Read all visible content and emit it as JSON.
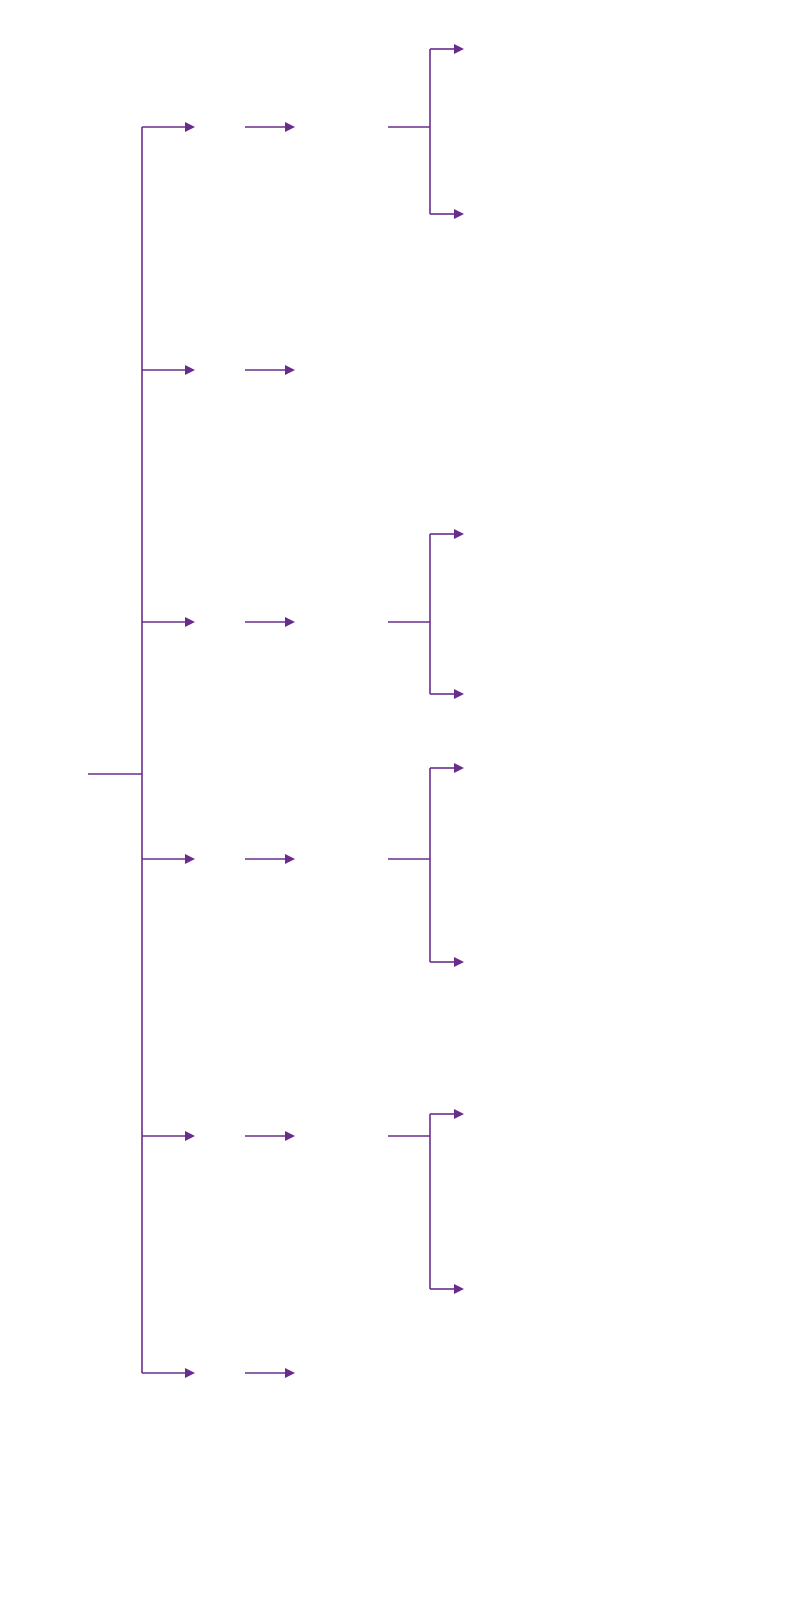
{
  "root": {
    "label": "hCG, LH, T e E2"
  },
  "branches": [
    {
      "id": "hcg",
      "result": "↑ hCG",
      "next": "US testicular",
      "outcomes": [
        "Massa: tumor testicular de células germinativas",
        "Normal: tumor germinativo extragonadal"
      ]
    },
    {
      "id": "lh-up-t-down",
      "result": "↑ LH, ↓ T",
      "next": "Hipogonadismo primário",
      "outcomes": []
    },
    {
      "id": "lh-down-t-down",
      "result": "↓ ou N LH, ↓ T",
      "next": "Medir prolactina",
      "outcomes": [
        "Elevada: tumor hipofisário",
        "Normal: hipogonadismo secundário"
      ]
    },
    {
      "id": "lh-up-t-up",
      "result": "↑ LH, ↑ T",
      "next_main": "Medir T",
      "next_sub": "4",
      "next_tail": "e TSH",
      "outcomes_a_pre": "↑ T",
      "outcomes_a_sub": "4",
      "outcomes_a_post": ", ↓ TSH:",
      "outcomes_a_line2": "hipertireoidismo",
      "outcomes": [
        "↑ T4, ↓ TSH: hipertireoidismo",
        "Normal: resistência androgênica"
      ]
    },
    {
      "id": "e2-up-lh-down",
      "result": "↑ E2, ↓ LH",
      "next": "US testicular",
      "outcomes": [
        "Massa: tumor de células de Leydig ou células de Sertoli",
        "Normal: TC ou RM suprarrenal"
      ],
      "sub_outcomes": [
        "Massa: tumor suprarrenal",
        "↑ Aromatase extraglandular"
      ]
    },
    {
      "id": "normal",
      "result": "Normal",
      "next": "Ginecomastia idiopática",
      "outcomes": []
    }
  ],
  "caption": {
    "figure_label": "FIGURA 27.4",
    "text": " – Fluxograma para investigação de ginecomastia."
  },
  "colors": {
    "arrow": "#6a2c8c",
    "box_fill": "#eef1f9",
    "root_fill": "#dcdcf0",
    "caption_label": "#6a2c8c"
  }
}
